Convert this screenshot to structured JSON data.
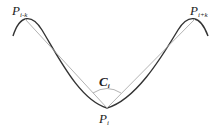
{
  "diagram": {
    "type": "curvature-illustration",
    "labels": {
      "p_left": {
        "main": "P",
        "sub": "i-k"
      },
      "p_right": {
        "main": "P",
        "sub": "i+k"
      },
      "p_center": {
        "main": "P",
        "sub": "i"
      },
      "angle": {
        "main": "C",
        "sub": "i"
      }
    },
    "colors": {
      "curve": "#333333",
      "chord": "#aaaaaa",
      "text": "#222222"
    }
  }
}
